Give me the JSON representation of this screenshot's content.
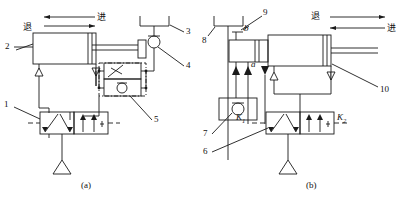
{
  "figure": {
    "title": "",
    "subfigures": [
      {
        "id": "a",
        "caption": "(a)"
      },
      {
        "id": "b",
        "caption": "(b)"
      }
    ]
  },
  "diagram_a": {
    "motion_labels": {
      "retract": "退",
      "advance": "进"
    },
    "callouts": [
      {
        "id": "1",
        "label": "1",
        "target": "directional-control-valve"
      },
      {
        "id": "2",
        "label": "2",
        "target": "cylinder-head-port"
      },
      {
        "id": "3",
        "label": "3",
        "target": "muffler"
      },
      {
        "id": "4",
        "label": "4",
        "target": "quick-exhaust-check-valve"
      },
      {
        "id": "5",
        "label": "5",
        "target": "one-way-throttle-valve"
      }
    ],
    "components": {
      "cylinder": "pneumatic-cylinder",
      "valve": "two-position-five-port-valve",
      "muffler": "muffler",
      "check_valve": "check-valve",
      "throttle_valve": "one-way-throttle-valve",
      "air_supply": "air-supply-source"
    }
  },
  "diagram_b": {
    "motion_labels": {
      "retract": "退",
      "advance": "进"
    },
    "port_labels": {
      "a": "a",
      "b": "b"
    },
    "valve_signal_labels": {
      "left": "K",
      "left_sub": "1",
      "right": "K",
      "right_sub": "2"
    },
    "callouts": [
      {
        "id": "6",
        "label": "6",
        "target": "directional-control-valve"
      },
      {
        "id": "7",
        "label": "7",
        "target": "check-valve-block"
      },
      {
        "id": "8",
        "label": "8",
        "target": "muffler"
      },
      {
        "id": "9",
        "label": "9",
        "target": "cylinder-rod-end-port"
      },
      {
        "id": "10",
        "label": "10",
        "target": "cylinder-cap-end-port"
      }
    ],
    "components": {
      "cylinder": "pneumatic-cylinder",
      "valve": "two-position-five-port-valve",
      "muffler": "muffler",
      "check_valve": "check-valve",
      "air_supply": "air-supply-source"
    }
  },
  "colors": {
    "line": "#1a1a1a",
    "background": "#ffffff"
  }
}
